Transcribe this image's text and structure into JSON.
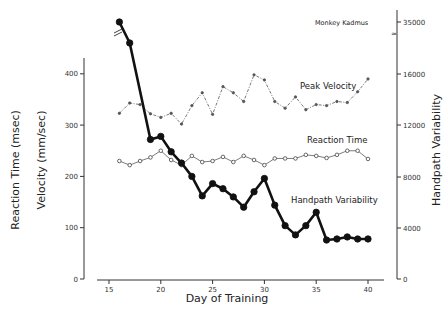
{
  "chart_data": {
    "type": "line",
    "title": "Monkey Kadmus",
    "xlabel": "Day of Training",
    "ylabel_left": [
      "Reaction Time (msec)",
      "Velocity (mm/sec)"
    ],
    "ylabel_right": "Handpath Variability",
    "x_ticks": [
      15,
      20,
      25,
      30,
      35,
      40
    ],
    "y_left_ticks": [
      0,
      100,
      200,
      300,
      400
    ],
    "y_right_ticks": [
      0,
      4000,
      8000,
      12000,
      16000,
      35000
    ],
    "xlim": [
      14,
      41
    ],
    "ylim_left": [
      0,
      430
    ],
    "ylim_right": [
      0,
      35000
    ],
    "grid": false,
    "axis_break_right": "between 16000 and 35000",
    "x": [
      16,
      17,
      18,
      19,
      20,
      21,
      22,
      23,
      24,
      25,
      26,
      27,
      28,
      29,
      30,
      31,
      32,
      33,
      34,
      35,
      36,
      37,
      38,
      39,
      40
    ],
    "series": [
      {
        "name": "Peak Velocity",
        "axis": "left",
        "style": "dash-dot thin, small dots",
        "values": [
          323,
          343,
          340,
          322,
          315,
          323,
          302,
          338,
          363,
          321,
          375,
          363,
          346,
          398,
          388,
          346,
          333,
          355,
          330,
          340,
          338,
          346,
          344,
          365,
          390
        ]
      },
      {
        "name": "Reaction Time",
        "axis": "left",
        "style": "thin solid, open circles",
        "values": [
          230,
          222,
          230,
          237,
          250,
          232,
          222,
          240,
          228,
          230,
          238,
          228,
          240,
          232,
          222,
          235,
          235,
          235,
          242,
          240,
          236,
          242,
          250,
          250,
          234
        ]
      },
      {
        "name": "Handpath Variability",
        "axis": "right",
        "style": "thick solid, filled circles",
        "values": [
          35000,
          15400,
          null,
          null,
          null,
          null,
          null,
          null,
          null,
          null,
          null,
          null,
          null,
          null,
          null,
          null,
          null,
          null,
          null,
          null,
          null,
          null,
          null,
          null,
          null
        ],
        "values_left_scale_equiv": [
          500,
          460,
          null,
          272,
          278,
          248,
          226,
          200,
          162,
          186,
          176,
          160,
          140,
          170,
          196,
          144,
          104,
          86,
          104,
          130,
          76,
          78,
          82,
          78,
          78
        ],
        "values_estimated": [
          35000,
          15400,
          null,
          10900,
          11100,
          9900,
          9000,
          8000,
          6500,
          7450,
          7050,
          6400,
          5600,
          6800,
          7850,
          5750,
          4150,
          3450,
          4150,
          5200,
          3050,
          3100,
          3300,
          3100,
          3100
        ]
      }
    ],
    "annotations": [
      "Monkey Kadmus",
      "Peak Velocity",
      "Reaction Time",
      "Handpath Variability"
    ]
  },
  "labels": {
    "title": "Monkey Kadmus",
    "xlabel": "Day of Training",
    "ylabel_outer": "Reaction Time (msec)",
    "ylabel_inner": "Velocity (mm/sec)",
    "ylabel_right": "Handpath Variability",
    "series_peak": "Peak Velocity",
    "series_rt": "Reaction Time",
    "series_hv": "Handpath Variability"
  },
  "ticks": {
    "x": [
      "15",
      "20",
      "25",
      "30",
      "35",
      "40"
    ],
    "left": [
      "0",
      "100",
      "200",
      "300",
      "400"
    ],
    "right": [
      "0",
      "4000",
      "8000",
      "12000",
      "16000",
      "35000"
    ]
  }
}
